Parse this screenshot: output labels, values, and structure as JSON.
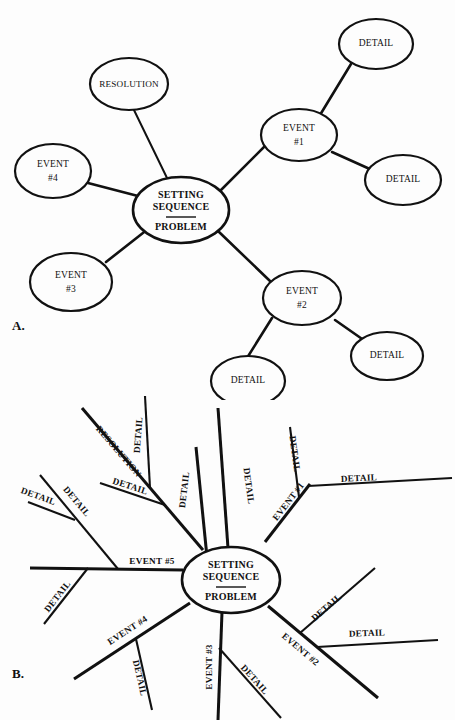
{
  "page": {
    "background": "#fdfdfd",
    "ink": "#111111",
    "panels": [
      {
        "id": "A",
        "letter": "A.",
        "style": "bubble-map"
      },
      {
        "id": "B",
        "letter": "B.",
        "style": "radial-spoke-map"
      }
    ]
  },
  "diagram_a": {
    "title": "Story map with elliptical nodes",
    "center": {
      "line1": "SETTING",
      "line2": "SEQUENCE",
      "line3": "PROBLEM",
      "has_divider": true
    },
    "nodes": [
      {
        "key": "resolution",
        "label_lines": [
          "RESOLUTION"
        ]
      },
      {
        "key": "event4",
        "label_lines": [
          "EVENT",
          "#4"
        ]
      },
      {
        "key": "event3",
        "label_lines": [
          "EVENT",
          "#3"
        ]
      },
      {
        "key": "event1",
        "label_lines": [
          "EVENT",
          "#1"
        ]
      },
      {
        "key": "event1_detail_top",
        "label_lines": [
          "DETAIL"
        ]
      },
      {
        "key": "event1_detail_right",
        "label_lines": [
          "DETAIL"
        ]
      },
      {
        "key": "event2",
        "label_lines": [
          "EVENT",
          "#2"
        ]
      },
      {
        "key": "event2_detail_left",
        "label_lines": [
          "DETAIL"
        ]
      },
      {
        "key": "event2_detail_right",
        "label_lines": [
          "DETAIL"
        ]
      }
    ]
  },
  "diagram_b": {
    "title": "Story map with radial lines",
    "center": {
      "line1": "SETTING",
      "line2": "SEQUENCE",
      "line3": "PROBLEM",
      "has_divider": true
    },
    "spokes": [
      {
        "key": "event1",
        "label": "EVENT #1",
        "details": [
          "DETAIL",
          "DETAIL"
        ]
      },
      {
        "key": "event2",
        "label": "EVENT #2",
        "details": [
          "DETAIL",
          "DETAIL"
        ]
      },
      {
        "key": "event3",
        "label": "EVENT #3",
        "details": [
          "DETAIL"
        ]
      },
      {
        "key": "event4",
        "label": "EVENT #4",
        "details": [
          "DETAIL",
          "DETAIL"
        ]
      },
      {
        "key": "event5",
        "label": "EVENT #5",
        "details": [
          "DETAIL",
          "DETAIL"
        ]
      },
      {
        "key": "resolution",
        "label": "RESOLUTION",
        "details": [
          "DETAIL",
          "DETAIL"
        ]
      },
      {
        "key": "unlabeled_top",
        "label": "",
        "details": [
          "DETAIL",
          "DETAIL"
        ]
      }
    ],
    "labels": {
      "detail": "DETAIL",
      "resolution": "RESOLUTION",
      "event1": "EVENT #1",
      "event2": "EVENT #2",
      "event3": "EVENT #3",
      "event4": "EVENT #4",
      "event5": "EVENT #5"
    }
  }
}
